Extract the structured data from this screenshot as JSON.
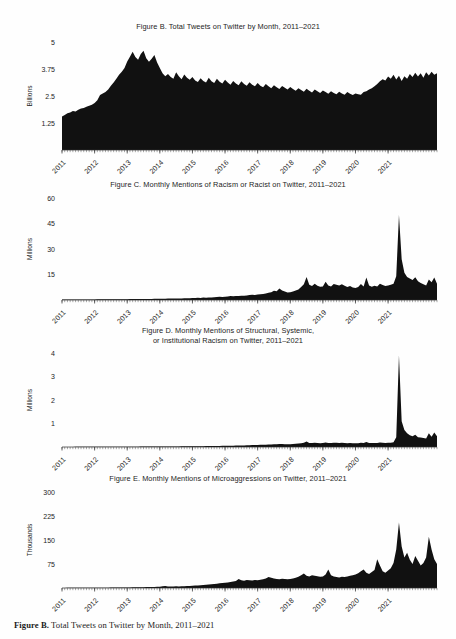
{
  "page": {
    "background_color": "#fefefe",
    "ink_color": "#111111"
  },
  "caption": {
    "bold_prefix": "Figure B.",
    "text": " Total Tweets on Twitter by Month, 2011–2021"
  },
  "figures": [
    {
      "id": "figure-b",
      "title_lines": [
        "Figure B. Total Tweets on Twitter by Month, 2011–2021"
      ],
      "y_axis_label": "Billions"
    },
    {
      "id": "figure-c",
      "title_lines": [
        "Figure C. Monthly Mentions of Racism or Racist on Twitter, 2011–2021"
      ],
      "y_axis_label": "Millions"
    },
    {
      "id": "figure-d",
      "title_lines": [
        "Figure D. Monthly Mentions of Structural, Systemic,",
        "or Institutional Racism on Twitter, 2011–2021"
      ],
      "y_axis_label": "Millions"
    },
    {
      "id": "figure-e",
      "title_lines": [
        "Figure E. Monthly Mentions of Microaggressions on Twitter, 2011–2021"
      ],
      "y_axis_label": "Thousands"
    }
  ],
  "chart_data": [
    {
      "type": "area",
      "id": "figure-b",
      "title": "Figure B. Total Tweets on Twitter by Month, 2011–2021",
      "xlabel": "",
      "ylabel": "Billions",
      "ylim": [
        0,
        5
      ],
      "yticks": [
        1.25,
        2.5,
        3.75,
        5
      ],
      "ytick_labels": [
        "1.25",
        "2.5",
        "3.75",
        "5"
      ],
      "xticks": [
        "2011",
        "2012",
        "2013",
        "2014",
        "2015",
        "2016",
        "2017",
        "2018",
        "2019",
        "2020",
        "2021"
      ],
      "x_start": "2011-01",
      "x_end": "2021-07",
      "grid": false,
      "legend": "none",
      "units": "billions of tweets per month",
      "values": [
        1.55,
        1.62,
        1.7,
        1.74,
        1.8,
        1.78,
        1.86,
        1.92,
        1.95,
        2.0,
        2.05,
        2.1,
        2.18,
        2.3,
        2.55,
        2.62,
        2.68,
        2.8,
        2.98,
        3.12,
        3.3,
        3.48,
        3.62,
        3.8,
        4.1,
        4.32,
        4.55,
        4.3,
        4.18,
        4.45,
        4.6,
        4.25,
        4.08,
        4.22,
        4.4,
        4.05,
        3.8,
        3.55,
        3.42,
        3.52,
        3.38,
        3.3,
        3.6,
        3.42,
        3.28,
        3.5,
        3.34,
        3.25,
        3.38,
        3.22,
        3.15,
        3.32,
        3.2,
        3.12,
        3.35,
        3.18,
        3.1,
        3.3,
        3.16,
        3.08,
        3.25,
        3.12,
        3.02,
        3.2,
        3.08,
        3.0,
        3.18,
        3.06,
        2.98,
        3.14,
        3.02,
        2.95,
        3.1,
        2.98,
        2.9,
        3.05,
        2.95,
        2.86,
        3.0,
        2.9,
        2.82,
        2.96,
        2.88,
        2.8,
        2.92,
        2.82,
        2.74,
        2.86,
        2.78,
        2.7,
        2.84,
        2.74,
        2.66,
        2.8,
        2.72,
        2.64,
        2.76,
        2.68,
        2.6,
        2.72,
        2.64,
        2.58,
        2.7,
        2.62,
        2.56,
        2.68,
        2.6,
        2.55,
        2.62,
        2.58,
        2.56,
        2.68,
        2.72,
        2.8,
        2.86,
        2.95,
        3.05,
        3.18,
        3.28,
        3.22,
        3.4,
        3.3,
        3.48,
        3.26,
        3.44,
        3.2,
        3.42,
        3.3,
        3.52,
        3.38,
        3.58,
        3.4,
        3.55,
        3.34,
        3.6,
        3.45,
        3.62,
        3.48,
        3.55
      ]
    },
    {
      "type": "area",
      "id": "figure-c",
      "title": "Figure C. Monthly Mentions of Racism or Racist on Twitter, 2011–2021",
      "xlabel": "",
      "ylabel": "Millions",
      "ylim": [
        0,
        60
      ],
      "yticks": [
        15,
        30,
        45,
        60
      ],
      "ytick_labels": [
        "15",
        "30",
        "45",
        "60"
      ],
      "xticks": [
        "2011",
        "2012",
        "2013",
        "2014",
        "2015",
        "2016",
        "2017",
        "2018",
        "2019",
        "2020",
        "2021"
      ],
      "x_start": "2011-01",
      "x_end": "2021-07",
      "grid": false,
      "legend": "none",
      "units": "millions of mentions per month",
      "values": [
        0.25,
        0.26,
        0.28,
        0.27,
        0.3,
        0.29,
        0.31,
        0.3,
        0.32,
        0.33,
        0.35,
        0.34,
        0.36,
        0.38,
        0.37,
        0.4,
        0.39,
        0.41,
        0.43,
        0.42,
        0.45,
        0.44,
        0.46,
        0.48,
        0.5,
        0.52,
        0.55,
        0.54,
        0.58,
        0.57,
        0.6,
        0.62,
        0.65,
        0.64,
        0.68,
        0.7,
        0.72,
        0.75,
        0.8,
        0.95,
        0.85,
        0.88,
        0.9,
        0.92,
        0.95,
        1.0,
        1.05,
        1.1,
        1.15,
        1.2,
        1.3,
        1.25,
        1.4,
        1.35,
        1.45,
        1.5,
        1.6,
        1.7,
        1.85,
        1.8,
        1.95,
        2.1,
        2.3,
        2.2,
        2.4,
        2.35,
        2.55,
        2.5,
        2.7,
        2.9,
        3.1,
        2.95,
        3.2,
        3.4,
        3.6,
        3.8,
        4.2,
        4.6,
        5.4,
        5.2,
        6.8,
        5.6,
        5.0,
        4.4,
        4.6,
        5.0,
        5.6,
        6.2,
        7.6,
        9.2,
        13.6,
        9.0,
        8.2,
        9.6,
        8.4,
        7.8,
        8.0,
        10.8,
        8.6,
        8.0,
        9.4,
        9.0,
        8.6,
        9.2,
        8.4,
        7.6,
        8.2,
        7.4,
        7.0,
        7.6,
        9.4,
        8.0,
        13.2,
        8.6,
        7.8,
        8.4,
        8.0,
        9.6,
        8.8,
        8.2,
        8.6,
        9.0,
        9.6,
        14.0,
        50.0,
        24.0,
        16.0,
        13.6,
        12.6,
        11.8,
        13.4,
        11.0,
        10.0,
        9.2,
        8.6,
        12.0,
        10.4,
        13.2,
        9.6
      ]
    },
    {
      "type": "area",
      "id": "figure-d",
      "title": "Figure D. Monthly Mentions of Structural, Systemic, or Institutional Racism on Twitter, 2011–2021",
      "xlabel": "",
      "ylabel": "Millions",
      "ylim": [
        0,
        4
      ],
      "yticks": [
        1,
        2,
        3,
        4
      ],
      "ytick_labels": [
        "1",
        "2",
        "3",
        "4"
      ],
      "xticks": [
        "2011",
        "2012",
        "2013",
        "2014",
        "2015",
        "2016",
        "2017",
        "2018",
        "2019",
        "2020",
        "2021"
      ],
      "x_start": "2011-01",
      "x_end": "2021-07",
      "grid": false,
      "legend": "none",
      "units": "millions of mentions per month",
      "values": [
        0.004,
        0.004,
        0.005,
        0.005,
        0.005,
        0.006,
        0.006,
        0.006,
        0.007,
        0.007,
        0.007,
        0.008,
        0.008,
        0.008,
        0.009,
        0.009,
        0.01,
        0.01,
        0.01,
        0.011,
        0.011,
        0.012,
        0.012,
        0.013,
        0.013,
        0.014,
        0.014,
        0.015,
        0.015,
        0.016,
        0.016,
        0.017,
        0.018,
        0.018,
        0.019,
        0.02,
        0.02,
        0.021,
        0.022,
        0.023,
        0.023,
        0.024,
        0.025,
        0.026,
        0.027,
        0.028,
        0.029,
        0.03,
        0.031,
        0.032,
        0.034,
        0.035,
        0.036,
        0.038,
        0.039,
        0.041,
        0.042,
        0.044,
        0.046,
        0.048,
        0.05,
        0.052,
        0.055,
        0.057,
        0.06,
        0.062,
        0.065,
        0.068,
        0.072,
        0.075,
        0.08,
        0.084,
        0.088,
        0.092,
        0.096,
        0.1,
        0.105,
        0.11,
        0.12,
        0.115,
        0.13,
        0.125,
        0.12,
        0.115,
        0.118,
        0.125,
        0.135,
        0.145,
        0.16,
        0.18,
        0.23,
        0.175,
        0.165,
        0.185,
        0.17,
        0.16,
        0.165,
        0.195,
        0.175,
        0.168,
        0.185,
        0.18,
        0.172,
        0.18,
        0.17,
        0.162,
        0.17,
        0.158,
        0.155,
        0.162,
        0.185,
        0.168,
        0.215,
        0.175,
        0.165,
        0.172,
        0.168,
        0.19,
        0.18,
        0.172,
        0.178,
        0.185,
        0.2,
        0.42,
        3.9,
        1.1,
        0.72,
        0.58,
        0.5,
        0.46,
        0.52,
        0.42,
        0.4,
        0.38,
        0.36,
        0.58,
        0.44,
        0.62,
        0.46
      ]
    },
    {
      "type": "area",
      "id": "figure-e",
      "title": "Figure E. Monthly Mentions of Microaggressions on Twitter, 2011–2021",
      "xlabel": "",
      "ylabel": "Thousands",
      "ylim": [
        0,
        300
      ],
      "yticks": [
        75,
        150,
        225,
        300
      ],
      "ytick_labels": [
        "75",
        "150",
        "225",
        "300"
      ],
      "xticks": [
        "2011",
        "2012",
        "2013",
        "2014",
        "2015",
        "2016",
        "2017",
        "2018",
        "2019",
        "2020",
        "2021"
      ],
      "x_start": "2011-01",
      "x_end": "2021-07",
      "grid": false,
      "legend": "none",
      "units": "thousands of mentions per month",
      "values": [
        0.3,
        0.3,
        0.4,
        0.4,
        0.5,
        0.5,
        0.5,
        0.6,
        0.6,
        0.7,
        0.7,
        0.8,
        0.8,
        0.9,
        0.9,
        1.0,
        1.0,
        1.1,
        1.2,
        1.2,
        1.3,
        1.4,
        1.5,
        1.6,
        1.7,
        1.8,
        2.0,
        2.1,
        2.3,
        2.4,
        2.6,
        2.8,
        3.0,
        3.2,
        3.5,
        3.8,
        4.2,
        5.5,
        6.2,
        5.0,
        4.6,
        4.8,
        5.2,
        5.0,
        5.4,
        5.8,
        6.2,
        6.6,
        7.0,
        7.5,
        8.2,
        8.8,
        9.5,
        10.2,
        11.0,
        11.8,
        12.6,
        13.5,
        14.5,
        15.5,
        16.5,
        17.5,
        19.0,
        20.5,
        22.0,
        28.0,
        24.0,
        23.0,
        25.0,
        24.0,
        23.5,
        25.0,
        24.0,
        25.5,
        27.0,
        30.0,
        34.0,
        32.0,
        30.0,
        28.5,
        27.5,
        29.0,
        28.0,
        27.0,
        28.5,
        30.0,
        32.0,
        35.0,
        40.0,
        45.0,
        38.0,
        36.0,
        40.0,
        38.0,
        36.5,
        35.0,
        36.0,
        42.0,
        58.0,
        40.0,
        36.0,
        34.0,
        33.0,
        35.0,
        34.0,
        36.0,
        38.0,
        40.0,
        42.0,
        46.0,
        52.0,
        58.0,
        48.0,
        44.0,
        50.0,
        56.0,
        90.0,
        70.0,
        52.0,
        48.0,
        55.0,
        62.0,
        78.0,
        120.0,
        205.0,
        130.0,
        95.0,
        110.0,
        88.0,
        75.0,
        100.0,
        85.0,
        70.0,
        78.0,
        95.0,
        160.0,
        120.0,
        90.0,
        75.0
      ]
    }
  ]
}
